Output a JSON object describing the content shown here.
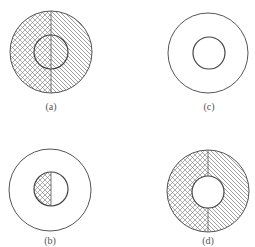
{
  "figure": {
    "stroke_color": "#555555",
    "hatch_color": "#777777",
    "background": "#ffffff",
    "panels": [
      {
        "id": "a",
        "label": "(a)",
        "outer": {
          "cx": 51,
          "cy": 52,
          "r": 41
        },
        "inner": {
          "cx": 51,
          "cy": 52,
          "r": 17
        },
        "fill": "outer and inner both hatched: left half cross-hatched, right half diagonal-hatched",
        "label_pos": {
          "x": 51,
          "y": 110
        }
      },
      {
        "id": "c",
        "label": "(c)",
        "outer": {
          "cx": 208,
          "cy": 53,
          "r": 40
        },
        "inner": {
          "cx": 209,
          "cy": 53,
          "r": 16
        },
        "fill": "none",
        "label_pos": {
          "x": 209,
          "y": 110
        }
      },
      {
        "id": "b",
        "label": "(b)",
        "outer": {
          "cx": 50,
          "cy": 190,
          "r": 41
        },
        "inner": {
          "cx": 51,
          "cy": 189,
          "r": 17
        },
        "fill": "inner circle only: left half cross-hatched, right half empty",
        "label_pos": {
          "x": 50,
          "y": 244
        }
      },
      {
        "id": "d",
        "label": "(d)",
        "outer": {
          "cx": 208,
          "cy": 191,
          "r": 41
        },
        "inner": {
          "cx": 208,
          "cy": 192,
          "r": 16
        },
        "fill": "annulus only: left half cross-hatched, right half diagonal-hatched; inner circle empty",
        "label_pos": {
          "x": 208,
          "y": 244
        }
      }
    ]
  }
}
